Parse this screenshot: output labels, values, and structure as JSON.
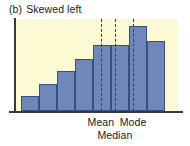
{
  "caption": {
    "index": "(b)",
    "text": "Skewed left"
  },
  "colors": {
    "plot_background": "#fbfad2",
    "bar_fill": "#6f88b9",
    "bar_border": "#37507f",
    "axis": "#3a3a3a",
    "refline": "#2c3f6b",
    "text": "#1a1a1a",
    "page_background": "#ffffff"
  },
  "annotations": {
    "mean_label": "Mean",
    "mode_label": "Mode",
    "median_label": "Median"
  },
  "chart_data": {
    "type": "bar",
    "xlabel": "",
    "ylabel": "",
    "grid": false,
    "legend": "none",
    "categories": [
      "1",
      "2",
      "3",
      "4",
      "5",
      "6",
      "7",
      "8"
    ],
    "values": [
      16,
      29,
      44,
      57,
      72,
      72,
      92,
      76
    ],
    "ylim": [
      0,
      100
    ],
    "bar_count": 8,
    "annotations": [
      {
        "label": "Mean",
        "x_fraction": 0.527,
        "style": "dashed-vertical"
      },
      {
        "label": "Median",
        "x_fraction": 0.613,
        "style": "dashed-vertical"
      },
      {
        "label": "Mode",
        "x_fraction": 0.724,
        "style": "dashed-vertical"
      }
    ],
    "shape": "left-skewed"
  }
}
